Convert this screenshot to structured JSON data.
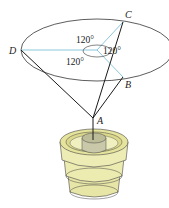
{
  "diagram": {
    "points": {
      "A": {
        "label": "A",
        "x": 93,
        "y": 118
      },
      "B": {
        "label": "B",
        "x": 123,
        "y": 77
      },
      "C": {
        "label": "C",
        "x": 123,
        "y": 22
      },
      "D": {
        "label": "D",
        "x": 21,
        "y": 50
      }
    },
    "angles": [
      {
        "label": "120°",
        "position": "top"
      },
      {
        "label": "120°",
        "position": "right"
      },
      {
        "label": "120°",
        "position": "bottom-left"
      }
    ],
    "colors": {
      "radial_lines": "#8cc8dc",
      "cables": "#1a1a1a",
      "ellipse": "#333333",
      "base_fill": "#ecebb0",
      "base_shade": "#d6d48a",
      "base_inner": "#c9c8a8"
    }
  }
}
